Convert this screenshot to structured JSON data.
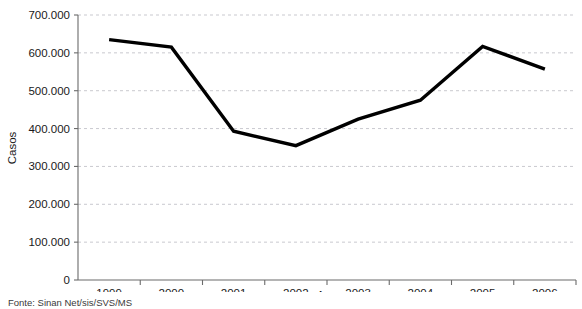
{
  "chart_data": {
    "type": "line",
    "title": "",
    "xlabel": "Ano",
    "ylabel": "Casos",
    "categories": [
      "1999",
      "2000",
      "2001",
      "2002",
      "2003",
      "2004",
      "2005",
      "2006"
    ],
    "values": [
      635000,
      615000,
      393000,
      355000,
      425000,
      475000,
      617000,
      557000
    ],
    "series": [
      {
        "name": "Casos",
        "values": [
          635000,
          615000,
          393000,
          355000,
          425000,
          475000,
          617000,
          557000
        ]
      }
    ],
    "ylim": [
      0,
      700000
    ],
    "ytick_labels": [
      "0",
      "100.000",
      "200.000",
      "300.000",
      "400.000",
      "500.000",
      "600.000",
      "700.000"
    ],
    "ytick_values": [
      0,
      100000,
      200000,
      300000,
      400000,
      500000,
      600000,
      700000
    ],
    "grid": "horizontal-dashed",
    "legend": "none",
    "line_color": "#000000",
    "grid_color": "#c9c9cf",
    "axis_color": "#6b6b6b"
  },
  "footer": {
    "source_note": "Fonte: Sinan Net/sis/SVS/MS"
  }
}
